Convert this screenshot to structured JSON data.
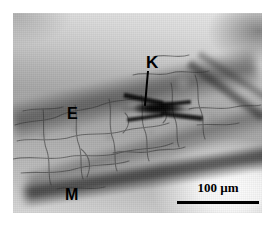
{
  "figure": {
    "type": "light-micrograph",
    "modality": "brightfield transmitted-light micrograph",
    "background_color": "#ffffff",
    "frame": {
      "left": 13,
      "top": 13,
      "width": 249,
      "height": 200,
      "border": "none"
    },
    "tone": {
      "min_gray": "#1a1a1a",
      "max_gray": "#ffffff",
      "mid_gray": "#a6a6a6"
    }
  },
  "annotations": {
    "label_k": {
      "text": "K",
      "name": "label-k",
      "color": "#000000",
      "meaning": "structure indicated by leader line"
    },
    "label_e": {
      "text": "E",
      "name": "label-e",
      "color": "#000000",
      "meaning": "epidermis region"
    },
    "label_m": {
      "text": "M",
      "name": "label-m",
      "color": "#000000",
      "meaning": "mesophyll / lower dark band region"
    },
    "leader_line": {
      "name": "k-leader-line",
      "color": "#000000",
      "from": "K label",
      "to": "dark stellate structure"
    }
  },
  "scale_bar": {
    "value": "100",
    "unit": "µm",
    "label": "100 µm",
    "bar_color": "#000000",
    "bar_length_px": 82,
    "position": "bottom-right"
  },
  "features": {
    "dark_structure": {
      "name": "dark-stellate-structure",
      "description": "dense near-black elongated stellate deposit at image centre"
    },
    "upper_band": {
      "name": "upper-dark-band",
      "description": "dark diagonal band sweeping from upper-left toward centre"
    },
    "lower_band": {
      "name": "lower-dark-band",
      "description": "dark diagonal band in lower-left running beneath the M label"
    },
    "strands": {
      "name": "upper-right-strands",
      "description": "two diagonal fibrous strands in the upper-right quadrant"
    },
    "bright_corner": {
      "name": "bright-lower-right-halo",
      "description": "blown-out bright region in the lower-right corner"
    },
    "cell_web": {
      "name": "cell-wall-network",
      "description": "thin dark polygonal cell-boundary network across the specimen"
    }
  }
}
